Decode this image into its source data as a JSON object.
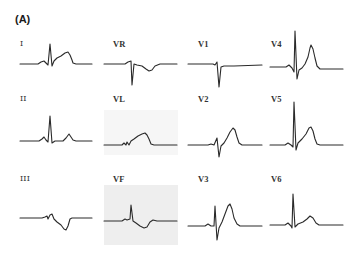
{
  "figure": {
    "panel_label": "(A)",
    "layout": {
      "columns": 4,
      "rows": 3
    },
    "leads": [
      {
        "id": "I",
        "label": "I",
        "row": 1,
        "col": 1
      },
      {
        "id": "VR",
        "label": "VR",
        "row": 1,
        "col": 2
      },
      {
        "id": "V1",
        "label": "V1",
        "row": 1,
        "col": 3
      },
      {
        "id": "V4",
        "label": "V4",
        "row": 1,
        "col": 4
      },
      {
        "id": "II",
        "label": "II",
        "row": 2,
        "col": 1
      },
      {
        "id": "VL",
        "label": "VL",
        "row": 2,
        "col": 2
      },
      {
        "id": "V2",
        "label": "V2",
        "row": 2,
        "col": 3
      },
      {
        "id": "V5",
        "label": "V5",
        "row": 2,
        "col": 4
      },
      {
        "id": "III",
        "label": "III",
        "row": 3,
        "col": 1
      },
      {
        "id": "VF",
        "label": "VF",
        "row": 3,
        "col": 2
      },
      {
        "id": "V3",
        "label": "V3",
        "row": 3,
        "col": 3
      },
      {
        "id": "V6",
        "label": "V6",
        "row": 3,
        "col": 4
      }
    ],
    "colors": {
      "trace": "#2a2a2a",
      "label": "#333333",
      "shaded_panel": "#eeeeee",
      "background": "#ffffff"
    }
  }
}
